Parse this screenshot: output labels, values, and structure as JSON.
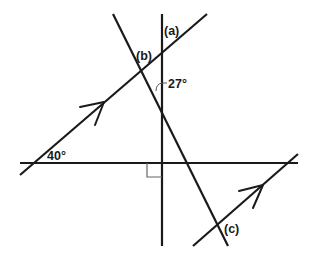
{
  "diagram": {
    "labels": {
      "a": "(a)",
      "b": "(b)",
      "c": "(c)",
      "angle_27": "27°",
      "angle_40": "40°"
    },
    "lines": [
      {
        "name": "vertical-line",
        "from": [
          162,
          14
        ],
        "to": [
          162,
          246
        ]
      },
      {
        "name": "horizontal-line",
        "from": [
          20,
          163
        ],
        "to": [
          298,
          163
        ]
      },
      {
        "name": "parallel-line-left",
        "from": [
          20,
          175
        ],
        "to": [
          207,
          14
        ],
        "has_arrow": true
      },
      {
        "name": "parallel-line-right",
        "from": [
          193,
          246
        ],
        "to": [
          298,
          154
        ],
        "has_arrow": true
      },
      {
        "name": "transversal-steep",
        "from": [
          113,
          14
        ],
        "to": [
          228,
          246
        ]
      }
    ],
    "given_angles": [
      {
        "value": "40°",
        "between": "parallel-line-left and horizontal-line"
      },
      {
        "value": "27°",
        "between": "vertical-line and transversal-steep"
      },
      {
        "value": "90°",
        "marker": "right-angle",
        "between": "vertical-line and horizontal-line"
      }
    ],
    "unknown_angles": [
      "(a)",
      "(b)",
      "(c)"
    ],
    "colors": {
      "line": "#1a1a1a",
      "right_angle_mark": "#666666",
      "background": "#ffffff"
    }
  }
}
